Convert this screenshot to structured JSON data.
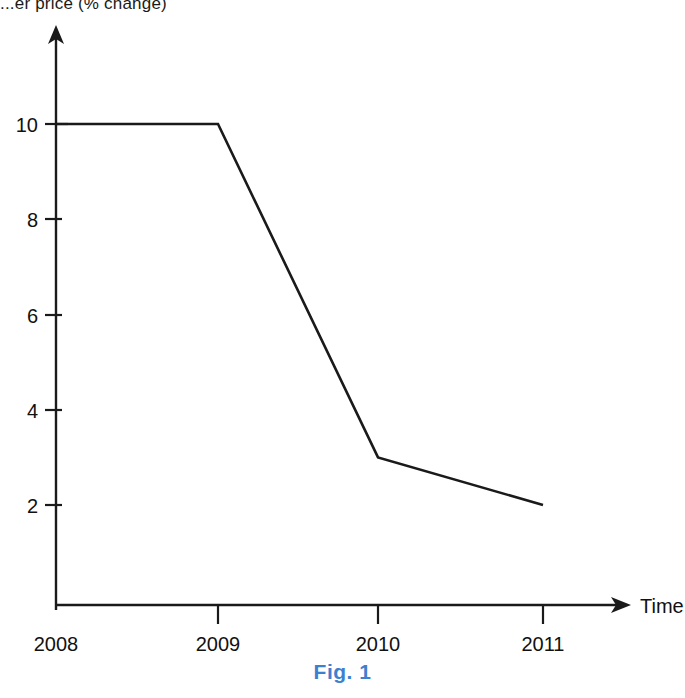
{
  "figure": {
    "partial_title": "...er price (% change)",
    "caption": "Fig. 1",
    "caption_color": "#3d7fd0",
    "line_color": "#1a1a1a",
    "axis_color": "#1a1a1a"
  },
  "chart_data": {
    "type": "line",
    "title": "...er price (% change)",
    "xlabel": "Time",
    "ylabel": "",
    "categories": [
      "2008",
      "2009",
      "2010",
      "2011"
    ],
    "values": [
      10,
      10,
      3,
      2
    ],
    "series": [
      {
        "name": "price change",
        "values": [
          10,
          10,
          3,
          2
        ]
      }
    ],
    "ytick_labels": [
      "10",
      "8",
      "6",
      "4",
      "2"
    ],
    "ytick_values": [
      10,
      8,
      6,
      4,
      2
    ],
    "xtick_labels": [
      "2008",
      "2009",
      "2010",
      "2011"
    ],
    "ylim": [
      0,
      11.6
    ],
    "xlim": [
      2008,
      2011.55
    ],
    "grid": false,
    "legend": false,
    "x_axis_arrow": true,
    "y_axis_arrow": true,
    "x_axis_label_text": "Time"
  }
}
